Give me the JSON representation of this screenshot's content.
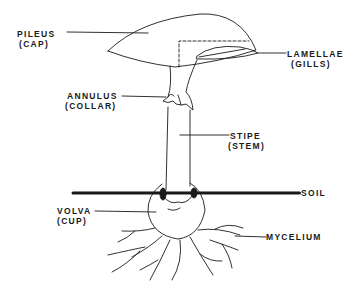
{
  "diagram": {
    "colors": {
      "ink": "#1a1a1a",
      "background": "#ffffff"
    },
    "labels": {
      "pileus": {
        "name": "PILEUS",
        "common": "(CAP)"
      },
      "lamellae": {
        "name": "LAMELLAE",
        "common": "(GILLS)"
      },
      "annulus": {
        "name": "ANNULUS",
        "common": "(COLLAR)"
      },
      "stipe": {
        "name": "STIPE",
        "common": "(STEM)"
      },
      "soil": {
        "name": "SOIL"
      },
      "volva": {
        "name": "VOLVA",
        "common": "(CUP)"
      },
      "mycelium": {
        "name": "MYCELIUM"
      }
    }
  }
}
